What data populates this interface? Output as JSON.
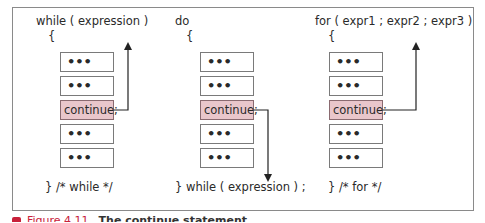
{
  "diagram": {
    "columns": [
      {
        "header": "while ( expression )",
        "open_brace": "{",
        "blocks": [
          "•••",
          "•••",
          "continue;",
          "•••",
          "•••"
        ],
        "highlight_index": 2,
        "footer": "} /* while */",
        "arrow_direction": "up"
      },
      {
        "header": "do",
        "open_brace": "{",
        "blocks": [
          "•••",
          "•••",
          "continue;",
          "•••",
          "•••"
        ],
        "highlight_index": 2,
        "footer": "}  while ( expression ) ;",
        "arrow_direction": "down"
      },
      {
        "header": "for ( expr1 ; expr2 ; expr3 )",
        "open_brace": "{",
        "blocks": [
          "•••",
          "•••",
          "continue;",
          "•••",
          "•••"
        ],
        "highlight_index": 2,
        "footer": "}  /* for */",
        "arrow_direction": "up"
      }
    ],
    "colors": {
      "highlight_fill": "#e9c6cb",
      "frame": "#8a8a8a",
      "caption_accent": "#c8203a"
    }
  },
  "caption": {
    "figure": "Figure 4.11",
    "title": "The continue statement"
  }
}
